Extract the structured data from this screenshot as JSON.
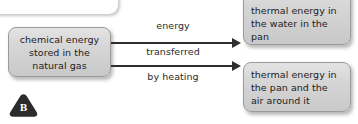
{
  "figure": {
    "type": "energy-transfer-flow-diagram",
    "label": "B",
    "background_color": "#ffffff",
    "node_fill_color": "#d6d6d6",
    "node_border_color": "#9a9a9a",
    "arrow_color": "#2e2e2e",
    "text_color": "#1c1c1c",
    "badge_color": "#2b2b2b"
  },
  "top_card": {
    "note": "partially cropped blank white rounded card at top edge"
  },
  "nodes": {
    "source": {
      "text": "chemical energy stored in the natural gas"
    },
    "targets": [
      {
        "text": "thermal energy in the water in the pan"
      },
      {
        "text": "thermal energy in the pan and the air around it"
      }
    ]
  },
  "arrow_captions": [
    {
      "text": "energy"
    },
    {
      "text": "transferred"
    },
    {
      "text": "by heating"
    }
  ],
  "badge": {
    "letter": "B"
  }
}
